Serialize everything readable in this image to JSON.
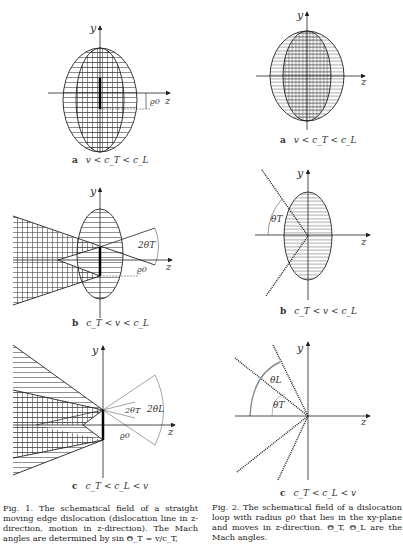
{
  "figure1": {
    "panels": [
      {
        "letter": "a",
        "condition": "v < c_T < c_L"
      },
      {
        "letter": "b",
        "condition": "c_T < v < c_L"
      },
      {
        "letter": "c",
        "condition": "c_T < c_L < v"
      }
    ],
    "axis_labels": {
      "y": "y",
      "z": "z"
    },
    "annotations": {
      "rho0": "ϱ0",
      "angle_b": "2θT",
      "angle_c_T": "2θT",
      "angle_c_L": "2θL"
    },
    "caption": "Fig. 1. The schematical field of a straight moving edge dislocation (dislocation line in z-direction, motion in z-direction). The Mach angles are determined by sin Θ_T = v/c_T,"
  },
  "figure2": {
    "panels": [
      {
        "letter": "a",
        "condition": "v < c_T < c_L"
      },
      {
        "letter": "b",
        "condition": "c_T < v < c_L"
      },
      {
        "letter": "c",
        "condition": "c_T < c_L < v"
      }
    ],
    "axis_labels": {
      "y": "y",
      "z": "z"
    },
    "annotations": {
      "angle_b": "θT",
      "angle_c_L": "θL",
      "angle_c_T": "θT"
    },
    "caption": "Fig. 2. The schematical field of a dislocation loop with radius ϱ0 that lies in the xy-plane and moves in z-direction. Θ_T, Θ_L are the Mach angles."
  }
}
